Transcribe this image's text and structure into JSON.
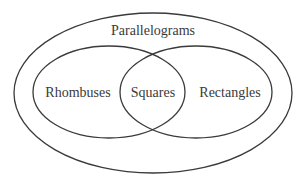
{
  "diagram": {
    "type": "venn",
    "stroke_color": "#3a3a3a",
    "background": "#ffffff",
    "sets": [
      {
        "id": "parallelograms",
        "label": "Parallelograms",
        "contains": [
          "rhombuses",
          "rectangles"
        ]
      },
      {
        "id": "rhombuses",
        "label": "Rhombuses"
      },
      {
        "id": "rectangles",
        "label": "Rectangles"
      }
    ],
    "intersection": {
      "sets": [
        "rhombuses",
        "rectangles"
      ],
      "label": "Squares"
    },
    "labels": {
      "outer": "Parallelograms",
      "left": "Rhombuses",
      "center": "Squares",
      "right": "Rectangles"
    }
  }
}
